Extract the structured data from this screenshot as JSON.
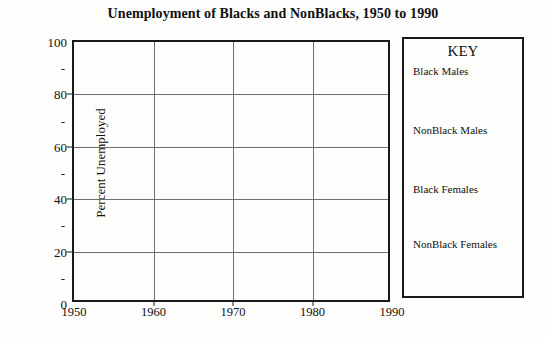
{
  "chart_data": {
    "type": "line",
    "title": "Unemployment of Blacks and NonBlacks, 1950 to 1990",
    "xlabel": "",
    "ylabel": "Percent Unemployed",
    "xlim": [
      1950,
      1990
    ],
    "ylim": [
      0,
      100
    ],
    "grid": true,
    "legend_position": "right",
    "note": "Blank template grid - no data series plotted in the figure",
    "x_ticks": [
      {
        "value": 1950,
        "label": "1950"
      },
      {
        "value": 1960,
        "label": "1960"
      },
      {
        "value": 1970,
        "label": "1970"
      },
      {
        "value": 1980,
        "label": "1980"
      },
      {
        "value": 1990,
        "label": "1990"
      }
    ],
    "y_major_ticks": [
      {
        "value": 100,
        "label": "100"
      },
      {
        "value": 80,
        "label": "80"
      },
      {
        "value": 60,
        "label": "60"
      },
      {
        "value": 40,
        "label": "40"
      },
      {
        "value": 20,
        "label": "20"
      },
      {
        "value": 0,
        "label": "0"
      }
    ],
    "y_minor_ticks": [
      {
        "value": 90,
        "label": "-"
      },
      {
        "value": 70,
        "label": "-"
      },
      {
        "value": 50,
        "label": "-"
      },
      {
        "value": 30,
        "label": "-"
      },
      {
        "value": 10,
        "label": "-"
      }
    ],
    "gridlines_y": [
      80,
      60,
      40,
      20
    ],
    "gridlines_x": [
      1960,
      1970,
      1980
    ],
    "series": [
      {
        "name": "Black Males",
        "values": []
      },
      {
        "name": "NonBlack Males",
        "values": []
      },
      {
        "name": "Black Females",
        "values": []
      },
      {
        "name": "NonBlack Females",
        "values": []
      }
    ]
  },
  "legend": {
    "title": "KEY",
    "items": [
      {
        "label": "Black Males",
        "top": 27
      },
      {
        "label": "NonBlack Males",
        "top": 86
      },
      {
        "label": "Black Females",
        "top": 145
      },
      {
        "label": "NonBlack Females",
        "top": 200
      }
    ]
  },
  "colors": {
    "background": "#fdfdfb",
    "axis": "#1a1a1a",
    "gridline": "#6f6f6f",
    "text": "#111111"
  }
}
